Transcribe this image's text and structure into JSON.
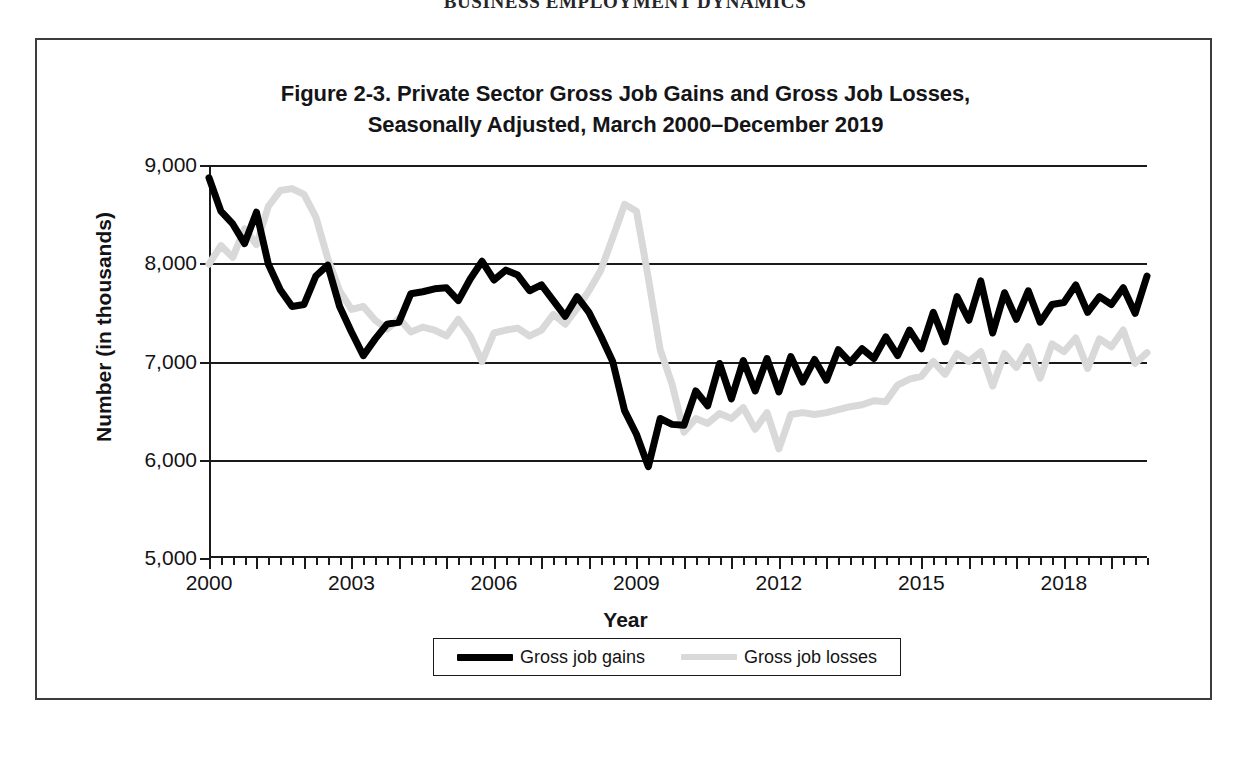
{
  "running_header": "BUSINESS EMPLOYMENT DYNAMICS",
  "figure": {
    "title_line1": "Figure 2-3. Private Sector Gross Job Gains and Gross Job Losses,",
    "title_line2": "Seasonally Adjusted, March 2000–December 2019"
  },
  "colors": {
    "gains": "#000000",
    "losses": "#d9d9d9",
    "axis": "#1a1a1d",
    "frame": "#3b3b40",
    "background": "#ffffff"
  },
  "chart_data": {
    "type": "line",
    "title": "Figure 2-3. Private Sector Gross Job Gains and Gross Job Losses, Seasonally Adjusted, March 2000–December 2019",
    "xlabel": "Year",
    "ylabel": "Number (in thousands)",
    "ylim": [
      5000,
      9000
    ],
    "ytick_labels": [
      "5,000",
      "6,000",
      "7,000",
      "8,000",
      "9,000"
    ],
    "ytick_values": [
      5000,
      6000,
      7000,
      8000,
      9000
    ],
    "xlim": [
      2000.0,
      2019.75
    ],
    "xtick_labels": [
      "2000",
      "2003",
      "2006",
      "2009",
      "2012",
      "2015",
      "2018"
    ],
    "xtick_values": [
      2000,
      2003,
      2006,
      2009,
      2012,
      2015,
      2018
    ],
    "minor_tick_interval_years": 0.25,
    "grid": "horizontal",
    "legend_position": "bottom",
    "x": [
      2000.0,
      2000.25,
      2000.5,
      2000.75,
      2001.0,
      2001.25,
      2001.5,
      2001.75,
      2002.0,
      2002.25,
      2002.5,
      2002.75,
      2003.0,
      2003.25,
      2003.5,
      2003.75,
      2004.0,
      2004.25,
      2004.5,
      2004.75,
      2005.0,
      2005.25,
      2005.5,
      2005.75,
      2006.0,
      2006.25,
      2006.5,
      2006.75,
      2007.0,
      2007.25,
      2007.5,
      2007.75,
      2008.0,
      2008.25,
      2008.5,
      2008.75,
      2009.0,
      2009.25,
      2009.5,
      2009.75,
      2010.0,
      2010.25,
      2010.5,
      2010.75,
      2011.0,
      2011.25,
      2011.5,
      2011.75,
      2012.0,
      2012.25,
      2012.5,
      2012.75,
      2013.0,
      2013.25,
      2013.5,
      2013.75,
      2014.0,
      2014.25,
      2014.5,
      2014.75,
      2015.0,
      2015.25,
      2015.5,
      2015.75,
      2016.0,
      2016.25,
      2016.5,
      2016.75,
      2017.0,
      2017.25,
      2017.5,
      2017.75,
      2018.0,
      2018.25,
      2018.5,
      2018.75,
      2019.0,
      2019.25,
      2019.5,
      2019.75
    ],
    "series": [
      {
        "name": "Gross job gains",
        "color": "#000000",
        "linewidth": 7,
        "values": [
          8870,
          8530,
          8400,
          8200,
          8520,
          7990,
          7730,
          7560,
          7580,
          7870,
          7980,
          7560,
          7300,
          7060,
          7230,
          7380,
          7400,
          7690,
          7710,
          7740,
          7750,
          7620,
          7840,
          8020,
          7830,
          7930,
          7880,
          7720,
          7780,
          7620,
          7460,
          7660,
          7500,
          7260,
          7000,
          6500,
          6260,
          5930,
          6420,
          6360,
          6350,
          6700,
          6550,
          6980,
          6620,
          7010,
          6700,
          7030,
          6690,
          7050,
          6790,
          7020,
          6810,
          7120,
          6990,
          7130,
          7030,
          7250,
          7060,
          7320,
          7130,
          7500,
          7200,
          7660,
          7420,
          7820,
          7290,
          7700,
          7430,
          7720,
          7400,
          7580,
          7600,
          7780,
          7500,
          7660,
          7580,
          7750,
          7490,
          7870
        ]
      },
      {
        "name": "Gross job losses",
        "color": "#d9d9d9",
        "linewidth": 7,
        "values": [
          7990,
          8180,
          8060,
          8350,
          8190,
          8580,
          8740,
          8760,
          8700,
          8470,
          8050,
          7720,
          7530,
          7560,
          7420,
          7330,
          7440,
          7300,
          7350,
          7320,
          7260,
          7430,
          7260,
          7000,
          7290,
          7320,
          7340,
          7260,
          7320,
          7480,
          7380,
          7540,
          7720,
          7930,
          8260,
          8600,
          8530,
          7850,
          7120,
          6770,
          6280,
          6420,
          6370,
          6470,
          6420,
          6530,
          6310,
          6480,
          6110,
          6460,
          6480,
          6460,
          6480,
          6510,
          6540,
          6560,
          6600,
          6590,
          6760,
          6820,
          6850,
          7000,
          6870,
          7080,
          7000,
          7100,
          6750,
          7080,
          6940,
          7150,
          6830,
          7180,
          7100,
          7240,
          6930,
          7230,
          7150,
          7320,
          6980,
          7090
        ]
      }
    ]
  },
  "legend": {
    "entries": [
      {
        "label": "Gross job gains",
        "swatch": "thick-black-line",
        "color": "#000000"
      },
      {
        "label": "Gross job losses",
        "swatch": "thick-gray-line",
        "color": "#d9d9d9"
      }
    ]
  }
}
